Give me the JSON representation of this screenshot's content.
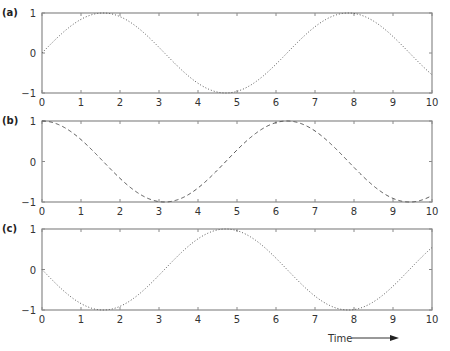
{
  "chart_data": [
    {
      "type": "line",
      "panel_label": "(a)",
      "function": "sin(t)",
      "line_style": "dotted",
      "x": [
        0,
        0.5,
        1,
        1.5,
        2,
        2.5,
        3,
        3.5,
        4,
        4.5,
        5,
        5.5,
        6,
        6.5,
        7,
        7.5,
        8,
        8.5,
        9,
        9.5,
        10
      ],
      "series": [
        {
          "name": "sin(t)",
          "values": [
            0,
            0.48,
            0.84,
            1.0,
            0.91,
            0.6,
            0.14,
            -0.35,
            -0.76,
            -0.98,
            -0.96,
            -0.71,
            -0.28,
            0.22,
            0.66,
            0.94,
            0.99,
            0.8,
            0.41,
            -0.08,
            -0.54
          ]
        }
      ],
      "xlim": [
        0,
        10
      ],
      "ylim": [
        -1,
        1
      ],
      "xticks": [
        "0",
        "1",
        "2",
        "3",
        "4",
        "5",
        "6",
        "7",
        "8",
        "9",
        "10"
      ],
      "yticks": [
        "−1",
        "0",
        "1"
      ],
      "xlabel": "",
      "ylabel": "",
      "grid": false
    },
    {
      "type": "line",
      "panel_label": "(b)",
      "function": "cos(t)",
      "line_style": "dashed",
      "x": [
        0,
        0.5,
        1,
        1.5,
        2,
        2.5,
        3,
        3.5,
        4,
        4.5,
        5,
        5.5,
        6,
        6.5,
        7,
        7.5,
        8,
        8.5,
        9,
        9.5,
        10
      ],
      "series": [
        {
          "name": "cos(t)",
          "values": [
            1.0,
            0.88,
            0.54,
            0.07,
            -0.42,
            -0.8,
            -0.99,
            -0.94,
            -0.65,
            -0.21,
            0.28,
            0.71,
            0.96,
            0.98,
            0.75,
            0.35,
            -0.15,
            -0.6,
            -0.91,
            -1.0,
            -0.84
          ]
        }
      ],
      "xlim": [
        0,
        10
      ],
      "ylim": [
        -1,
        1
      ],
      "xticks": [
        "0",
        "1",
        "2",
        "3",
        "4",
        "5",
        "6",
        "7",
        "8",
        "9",
        "10"
      ],
      "yticks": [
        "−1",
        "0",
        "1"
      ],
      "xlabel": "",
      "ylabel": "",
      "grid": false
    },
    {
      "type": "line",
      "panel_label": "(c)",
      "function": "-sin(t)",
      "line_style": "dotted",
      "x": [
        0,
        0.5,
        1,
        1.5,
        2,
        2.5,
        3,
        3.5,
        4,
        4.5,
        5,
        5.5,
        6,
        6.5,
        7,
        7.5,
        8,
        8.5,
        9,
        9.5,
        10
      ],
      "series": [
        {
          "name": "-sin(t)",
          "values": [
            0,
            -0.48,
            -0.84,
            -1.0,
            -0.91,
            -0.6,
            -0.14,
            0.35,
            0.76,
            0.98,
            0.96,
            0.71,
            0.28,
            -0.22,
            -0.66,
            -0.94,
            -0.99,
            -0.8,
            -0.41,
            0.08,
            0.54
          ]
        }
      ],
      "xlim": [
        0,
        10
      ],
      "ylim": [
        -1,
        1
      ],
      "xticks": [
        "0",
        "1",
        "2",
        "3",
        "4",
        "5",
        "6",
        "7",
        "8",
        "9",
        "10"
      ],
      "yticks": [
        "−1",
        "0",
        "1"
      ],
      "xlabel": "Time",
      "ylabel": "",
      "grid": false
    }
  ],
  "figure": {
    "xlabel": "Time",
    "xlabel_arrow": "right-arrow",
    "colors": {
      "axis": "#8a8a8a",
      "curve": "#555555",
      "text": "#333333"
    }
  }
}
